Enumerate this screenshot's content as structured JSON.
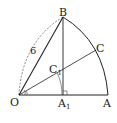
{
  "diagram": {
    "type": "geometry-sector",
    "points": {
      "O": {
        "label": "O",
        "x": 19,
        "y": 95
      },
      "A": {
        "label": "A",
        "x": 108,
        "y": 95
      },
      "B": {
        "label": "B",
        "x": 63,
        "y": 17
      },
      "C": {
        "label": "C",
        "x": 96,
        "y": 50
      },
      "A1": {
        "label": "A",
        "sub": "1",
        "x": 63,
        "y": 95
      },
      "C1": {
        "label": "C",
        "sub": "1",
        "x": 61,
        "y": 72
      }
    },
    "edge_label": "6",
    "colors": {
      "stroke": "#222222",
      "background": "#ffffff"
    }
  }
}
